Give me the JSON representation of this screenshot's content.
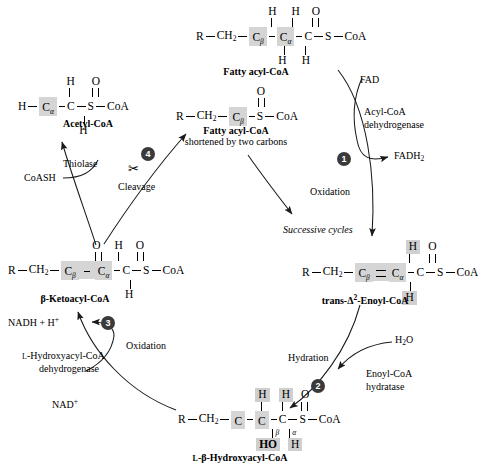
{
  "figure": {
    "accent_color": "#3a3a3a",
    "highlight_color": "#d5d5d5"
  },
  "molecules": {
    "fatty_acyl_coa_top": {
      "name": "Fatty acyl-CoA",
      "r": "R",
      "ch2": "CH",
      "ch2_sub": "2",
      "c_beta": "C",
      "c_beta_sub": "β",
      "c_alpha": "C",
      "c_alpha_sub": "α",
      "c_carbonyl": "C",
      "o": "O",
      "s": "S",
      "coa": "CoA",
      "h_top_beta": "H",
      "h_top_alpha": "H",
      "h_bot_beta": "H",
      "h_bot_alpha": "H"
    },
    "acetyl_coa": {
      "name": "Acetyl-CoA",
      "h_left": "H",
      "c_alpha": "C",
      "c_alpha_sub": "α",
      "c_carbonyl": "C",
      "o": "O",
      "s": "S",
      "coa": "CoA",
      "h_top": "H",
      "h_bot": "H"
    },
    "fatty_acyl_coa_short": {
      "name": "Fatty acyl-CoA",
      "name2": "shortened by two carbons",
      "r": "R",
      "ch2": "CH",
      "ch2_sub": "2",
      "c_beta": "C",
      "c_beta_sub": "β",
      "o": "O",
      "s": "S",
      "coa": "CoA"
    },
    "trans_enoyl_coa": {
      "name_prefix": "trans-",
      "name_delta": "Δ",
      "name_sup": "2",
      "name_rest": "-Enoyl-CoA",
      "r": "R",
      "ch2": "CH",
      "ch2_sub": "2",
      "c_beta": "C",
      "c_beta_sub": "β",
      "c_alpha": "C",
      "c_alpha_sub": "α",
      "c_carbonyl": "C",
      "o": "O",
      "s": "S",
      "coa": "CoA",
      "h_top": "H",
      "h_bot": "H"
    },
    "beta_ketoacyl_coa": {
      "name_prefix": "β",
      "name_rest": "-Ketoacyl-CoA",
      "r": "R",
      "ch2": "CH",
      "ch2_sub": "2",
      "c_beta": "C",
      "c_beta_sub": "β",
      "c_alpha": "C",
      "c_alpha_sub": "α",
      "c_carbonyl": "C",
      "o_beta": "O",
      "o_carbonyl": "O",
      "s": "S",
      "coa": "CoA",
      "h_top": "H",
      "h_bot": "H"
    },
    "hydroxyacyl_coa": {
      "name_prefix": "L",
      "name_beta": "-β-",
      "name_rest": "Hydroxyacyl-CoA",
      "r": "R",
      "ch2": "CH",
      "ch2_sub": "2",
      "c_beta": "C",
      "c_beta_sub": "β",
      "c_alpha": "C",
      "c_alpha_sub": "α",
      "c_carbonyl": "C",
      "o": "O",
      "s": "S",
      "coa": "CoA",
      "h_top_beta": "H",
      "h_top_alpha": "H",
      "ho": "HO",
      "h_bot_alpha": "H"
    }
  },
  "steps": {
    "one": "1",
    "two": "2",
    "three": "3",
    "four": "4"
  },
  "reactions": {
    "oxidation_1": "Oxidation",
    "hydration_2": "Hydration",
    "oxidation_3": "Oxidation",
    "cleavage_4": "Cleavage",
    "successive_cycles": "Successive cycles"
  },
  "enzymes": {
    "acyl_coa_dehydrogenase_l1": "Acyl-CoA",
    "acyl_coa_dehydrogenase_l2": "dehydrogenase",
    "enoyl_coa_hydratase_l1": "Enoyl-CoA",
    "enoyl_coa_hydratase_l2": "hydratase",
    "hydroxyacyl_dehydrogenase_l1_a": "L",
    "hydroxyacyl_dehydrogenase_l1_b": "-Hydroxyacyl-CoA",
    "hydroxyacyl_dehydrogenase_l2": "dehydrogenase",
    "thiolase": "Thiolase"
  },
  "cofactors": {
    "fad": "FAD",
    "fadh2": "FADH",
    "fadh2_sub": "2",
    "water": "H",
    "water_sub": "2",
    "water_o": "O",
    "nad_plus": "NAD",
    "nad_plus_sup": "+",
    "nadh": "NADH + H",
    "nadh_sup": "+",
    "coash": "CoASH"
  },
  "icons": {
    "scissors": "✂"
  }
}
